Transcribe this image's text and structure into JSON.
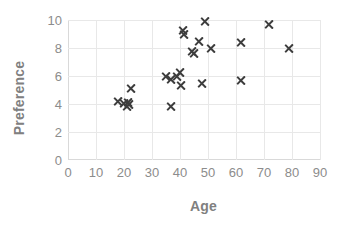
{
  "chart_data": {
    "type": "scatter",
    "title": "",
    "xlabel": "Age",
    "ylabel": "Preference",
    "xlim": [
      0,
      90
    ],
    "ylim": [
      0,
      10
    ],
    "xticks": [
      0,
      10,
      20,
      30,
      40,
      50,
      60,
      70,
      80,
      90
    ],
    "yticks": [
      0,
      2,
      4,
      6,
      8,
      10
    ],
    "grid": true,
    "legend": false,
    "marker": "x",
    "marker_color": "#3d3d3d",
    "grid_color": "#e8e8e8",
    "label_color": "#808080",
    "tick_color": "#8c8c8c",
    "background": "#ffffff",
    "series": [
      {
        "name": "Age vs Preference",
        "points": [
          {
            "x": 18,
            "y": 4.15
          },
          {
            "x": 20,
            "y": 4.05
          },
          {
            "x": 21,
            "y": 3.8
          },
          {
            "x": 21.5,
            "y": 4.1
          },
          {
            "x": 22,
            "y": 4.0
          },
          {
            "x": 22.5,
            "y": 5.1
          },
          {
            "x": 35,
            "y": 5.95
          },
          {
            "x": 37,
            "y": 5.75
          },
          {
            "x": 37,
            "y": 3.8
          },
          {
            "x": 39,
            "y": 6.0
          },
          {
            "x": 40,
            "y": 6.25
          },
          {
            "x": 40.5,
            "y": 5.3
          },
          {
            "x": 41,
            "y": 9.25
          },
          {
            "x": 41.5,
            "y": 8.95
          },
          {
            "x": 44.5,
            "y": 7.75
          },
          {
            "x": 45,
            "y": 7.6
          },
          {
            "x": 47,
            "y": 8.45
          },
          {
            "x": 48,
            "y": 5.5
          },
          {
            "x": 49,
            "y": 9.9
          },
          {
            "x": 51,
            "y": 8.0
          },
          {
            "x": 62,
            "y": 5.65
          },
          {
            "x": 62,
            "y": 8.4
          },
          {
            "x": 72,
            "y": 9.7
          },
          {
            "x": 79,
            "y": 8.0
          }
        ]
      }
    ]
  }
}
